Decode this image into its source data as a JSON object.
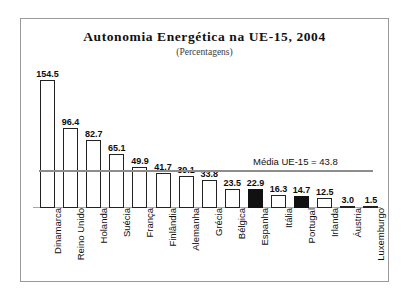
{
  "chart_data": {
    "type": "bar",
    "title": "Autonomia Energética na UE-15, 2004",
    "subtitle": "(Percentagens)",
    "xlabel": "",
    "ylabel": "",
    "ylim": [
      0,
      160
    ],
    "grid": false,
    "legend": "none",
    "categories": [
      "Dinamarca",
      "Reino Unido",
      "Holanda",
      "Suécia",
      "França",
      "Finlândia",
      "Alemanha",
      "Grécia",
      "Bélgica",
      "Espanha",
      "Itália",
      "Portugal",
      "Irlanda",
      "Áustria",
      "Luxemburgo"
    ],
    "values": [
      154.5,
      96.4,
      82.7,
      65.1,
      49.9,
      41.7,
      39.1,
      33.8,
      23.5,
      22.9,
      16.3,
      14.7,
      12.5,
      3.0,
      1.5
    ],
    "value_labels": [
      "154.5",
      "96.4",
      "82.7",
      "65.1",
      "49.9",
      "41.7",
      "39.1",
      "33.8",
      "23.5",
      "22.9",
      "16.3",
      "14.7",
      "12.5",
      "3.0",
      "1.5"
    ],
    "highlighted": [
      false,
      false,
      false,
      false,
      false,
      false,
      false,
      false,
      false,
      true,
      false,
      true,
      false,
      false,
      false
    ],
    "annotations": [
      {
        "name": "mean-reference",
        "text": "Média UE-15 = 43.8",
        "value": 43.8
      }
    ],
    "colors": {
      "bar_fill": "#ffffff",
      "bar_stroke": "#222222",
      "bar_highlight_fill": "#111111",
      "mean_line": "#8d8d8d",
      "axis": "#a7a7a7",
      "frame": "#9a9a9a",
      "text": "#111111",
      "background": "#ffffff"
    }
  }
}
